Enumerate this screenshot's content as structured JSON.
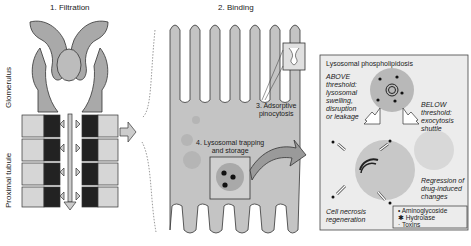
{
  "panels": {
    "filtration": {
      "title": "1. Filtration"
    },
    "binding": {
      "title": "2. Binding"
    }
  },
  "side_labels": {
    "glomerulus": "Glomerulus",
    "proximal_tubule": "Proximal tubule"
  },
  "steps": {
    "adsorptive": [
      "3. Adsorptive",
      "pinocytosis"
    ],
    "lysosomal": [
      "4. Lysosomal trapping",
      "and storage"
    ]
  },
  "inset": {
    "title": "Lysosomal phospholipidosis",
    "above": [
      "ABOVE",
      "threshold:",
      "lysosomal",
      "swelling,",
      "disruption",
      "or leakage"
    ],
    "below": [
      "BELOW",
      "threshold:",
      "exocytosis",
      "shuttle"
    ],
    "regression": [
      "Regression of",
      "drug-induced",
      "changes"
    ],
    "necrosis": [
      "Cell necrosis",
      "regeneration"
    ]
  },
  "legend": {
    "items": [
      {
        "symbol": "•",
        "label": "Aminoglycoside"
      },
      {
        "symbol": "✱",
        "label": "Hydrolase"
      },
      {
        "symbol": "·",
        "label": "Toxins"
      }
    ]
  },
  "colors": {
    "tissue": "#a9a9a9",
    "tissue_light": "#d6d6d6",
    "cell": "#c4c4c4",
    "inset_bg": "#e8e8e8",
    "ink": "#1a1a1a"
  }
}
